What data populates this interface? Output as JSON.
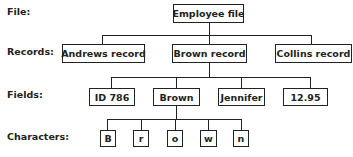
{
  "levels": {
    "file": "File:",
    "records": "Records:",
    "fields": "Fields:",
    "characters": "Characters:"
  },
  "file": {
    "label": "Employee file"
  },
  "records": [
    {
      "label": "Andrews record"
    },
    {
      "label": "Brown record"
    },
    {
      "label": "Collins record"
    }
  ],
  "fields": [
    {
      "label": "ID 786"
    },
    {
      "label": "Brown"
    },
    {
      "label": "Jennifer"
    },
    {
      "label": "12.95"
    }
  ],
  "characters": [
    {
      "label": "B"
    },
    {
      "label": "r"
    },
    {
      "label": "o"
    },
    {
      "label": "w"
    },
    {
      "label": "n"
    }
  ]
}
